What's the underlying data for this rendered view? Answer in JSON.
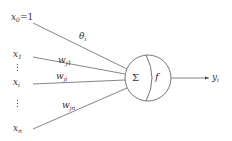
{
  "diagram": {
    "type": "artificial-neuron",
    "bias_input": {
      "name": "x",
      "sub": "0",
      "suffix": "=1"
    },
    "bias_weight": {
      "name": "θ",
      "sub": "i"
    },
    "inputs": [
      {
        "name": "x",
        "sub": "1",
        "weight": {
          "name": "w",
          "sub": "j1"
        }
      },
      {
        "name": "x",
        "sub": "i",
        "weight": {
          "name": "w",
          "sub": "ji"
        }
      },
      {
        "name": "x",
        "sub": "n",
        "weight": {
          "name": "w",
          "sub": "jn"
        }
      }
    ],
    "neuron": {
      "sum_symbol": "Σ",
      "activation_symbol": "f"
    },
    "output": {
      "name": "y",
      "sub": "i"
    },
    "colors": {
      "line": "#555555",
      "text": "#333333",
      "background": "#ffffff"
    }
  }
}
